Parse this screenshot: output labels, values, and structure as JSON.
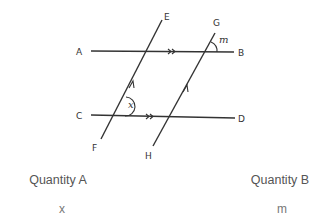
{
  "diagram": {
    "points": {
      "A": "A",
      "B": "B",
      "C": "C",
      "D": "D",
      "E": "E",
      "F": "F",
      "G": "G",
      "H": "H"
    },
    "angles": {
      "x": "x",
      "m": "m"
    },
    "line_color": "#333333",
    "marks": {
      "AB_parallel": "double-arrow",
      "CD_parallel": "double-arrow",
      "EF_parallel": "single-arrow",
      "GH_parallel": "single-arrow"
    }
  },
  "comparison": {
    "quantity_a": {
      "label": "Quantity A",
      "value": "x"
    },
    "quantity_b": {
      "label": "Quantity B",
      "value": "m"
    }
  }
}
